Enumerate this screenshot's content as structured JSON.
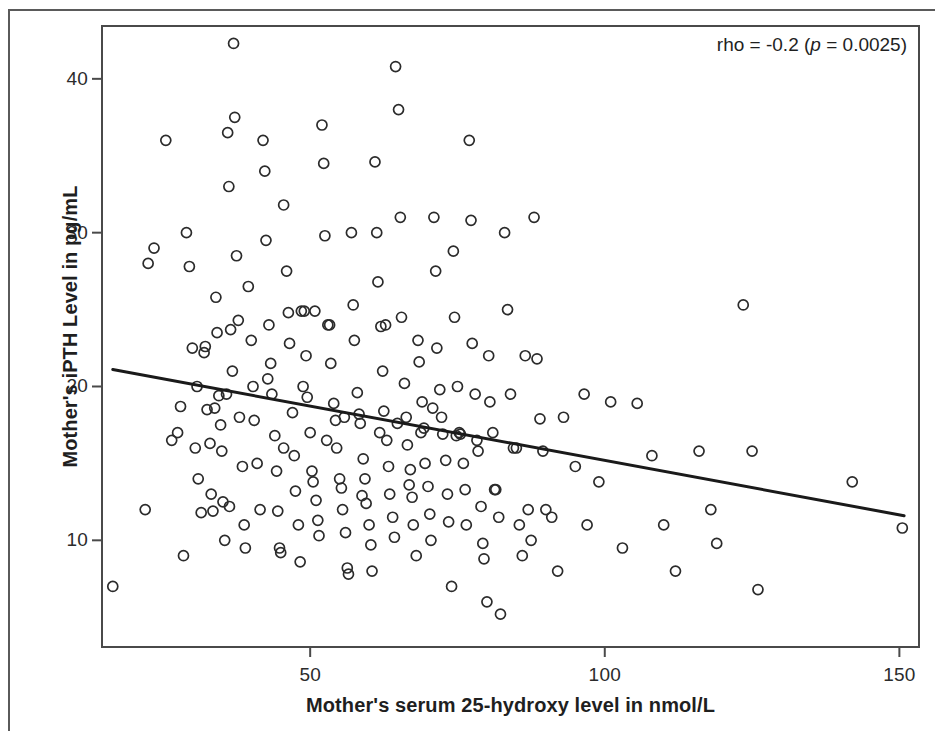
{
  "figure": {
    "background_color": "#ffffff",
    "frame_color": "#4a4a4a",
    "marker_color": "#2b2b2b",
    "line_color": "#1a1a1a"
  },
  "annotation": {
    "prefix": "rho = -0.2 (",
    "italic_p": "p",
    "suffix": " = 0.0025)",
    "full_text": "rho = -0.2 (p = 0.0025)"
  },
  "chart_data": {
    "type": "scatter",
    "title": "",
    "subtitle": "",
    "xlabel": "Mother's serum 25-hydroxy level in nmol/L",
    "ylabel": "Mother's iPTH Level in pg/mL",
    "xlim": [
      14.5,
      153.5
    ],
    "ylim": [
      3.0,
      43.5
    ],
    "xticks": [
      50,
      100,
      150
    ],
    "xtick_labels": [
      "50",
      "100",
      "150"
    ],
    "yticks": [
      10,
      20,
      30,
      40
    ],
    "ytick_labels": [
      "10",
      "20",
      "30",
      "40"
    ],
    "grid": false,
    "legend": null,
    "annotations": [
      {
        "text": "rho = -0.2 (p = 0.0025)",
        "position": "top-right",
        "statistic": "rho",
        "rho": -0.2,
        "p_value": 0.0025
      }
    ],
    "marker": {
      "style": "open-circle",
      "diameter_px": 10,
      "stroke_px": 1.7,
      "fill": "none"
    },
    "fit_line": {
      "type": "linear-regression",
      "x_start": 16.5,
      "y_start": 21.1,
      "x_end": 150.8,
      "y_end": 11.6,
      "slope": -0.0707,
      "intercept": 22.27,
      "width_px": 3
    },
    "n_points": 213,
    "points": [
      [
        16.5,
        7.0
      ],
      [
        22.0,
        12.0
      ],
      [
        23.5,
        29.0
      ],
      [
        22.5,
        28.0
      ],
      [
        25.5,
        36.0
      ],
      [
        26.5,
        16.5
      ],
      [
        27.5,
        17.0
      ],
      [
        28.0,
        18.7
      ],
      [
        28.5,
        9.0
      ],
      [
        29.0,
        30.0
      ],
      [
        29.5,
        27.8
      ],
      [
        30.0,
        22.5
      ],
      [
        30.5,
        16.0
      ],
      [
        31.0,
        14.0
      ],
      [
        31.5,
        11.8
      ],
      [
        32.0,
        22.2
      ],
      [
        32.2,
        22.6
      ],
      [
        32.5,
        18.5
      ],
      [
        33.0,
        16.3
      ],
      [
        33.2,
        13.0
      ],
      [
        33.5,
        11.9
      ],
      [
        34.0,
        25.8
      ],
      [
        34.2,
        23.5
      ],
      [
        34.5,
        19.4
      ],
      [
        34.8,
        17.5
      ],
      [
        35.0,
        15.8
      ],
      [
        35.2,
        12.5
      ],
      [
        35.5,
        10.0
      ],
      [
        36.0,
        36.5
      ],
      [
        36.2,
        33.0
      ],
      [
        36.5,
        23.7
      ],
      [
        36.8,
        21.0
      ],
      [
        37.0,
        42.3
      ],
      [
        37.2,
        37.5
      ],
      [
        37.5,
        28.5
      ],
      [
        37.8,
        24.3
      ],
      [
        38.0,
        18.0
      ],
      [
        38.5,
        14.8
      ],
      [
        38.8,
        11.0
      ],
      [
        39.0,
        9.5
      ],
      [
        39.5,
        26.5
      ],
      [
        40.0,
        23.0
      ],
      [
        40.3,
        20.0
      ],
      [
        40.5,
        17.8
      ],
      [
        41.0,
        15.0
      ],
      [
        41.5,
        12.0
      ],
      [
        42.0,
        36.0
      ],
      [
        42.3,
        34.0
      ],
      [
        42.5,
        29.5
      ],
      [
        43.0,
        24.0
      ],
      [
        43.3,
        21.5
      ],
      [
        43.5,
        19.5
      ],
      [
        44.0,
        16.8
      ],
      [
        44.3,
        14.5
      ],
      [
        44.5,
        11.9
      ],
      [
        45.0,
        9.2
      ],
      [
        45.5,
        31.8
      ],
      [
        46.0,
        27.5
      ],
      [
        46.3,
        24.8
      ],
      [
        46.5,
        22.8
      ],
      [
        47.0,
        18.3
      ],
      [
        47.3,
        15.5
      ],
      [
        47.5,
        13.2
      ],
      [
        48.0,
        11.0
      ],
      [
        48.3,
        8.6
      ],
      [
        48.5,
        24.9
      ],
      [
        49.0,
        24.9
      ],
      [
        49.3,
        22.0
      ],
      [
        49.5,
        19.3
      ],
      [
        50.0,
        17.0
      ],
      [
        50.3,
        14.5
      ],
      [
        50.5,
        13.8
      ],
      [
        51.0,
        12.6
      ],
      [
        51.3,
        11.3
      ],
      [
        51.5,
        10.3
      ],
      [
        52.0,
        37.0
      ],
      [
        52.3,
        34.5
      ],
      [
        52.5,
        29.8
      ],
      [
        53.0,
        24.0
      ],
      [
        53.3,
        24.0
      ],
      [
        53.5,
        21.5
      ],
      [
        54.0,
        18.9
      ],
      [
        54.3,
        17.8
      ],
      [
        54.5,
        16.0
      ],
      [
        55.0,
        14.0
      ],
      [
        55.3,
        13.4
      ],
      [
        55.5,
        12.0
      ],
      [
        56.0,
        10.5
      ],
      [
        56.3,
        8.2
      ],
      [
        56.5,
        7.8
      ],
      [
        57.0,
        30.0
      ],
      [
        57.3,
        25.3
      ],
      [
        57.5,
        23.0
      ],
      [
        58.0,
        19.6
      ],
      [
        58.3,
        18.2
      ],
      [
        58.5,
        17.6
      ],
      [
        59.0,
        15.3
      ],
      [
        59.3,
        14.0
      ],
      [
        59.5,
        12.4
      ],
      [
        60.0,
        11.0
      ],
      [
        60.3,
        9.7
      ],
      [
        60.5,
        8.0
      ],
      [
        61.0,
        34.6
      ],
      [
        61.3,
        30.0
      ],
      [
        61.5,
        26.8
      ],
      [
        62.0,
        23.9
      ],
      [
        62.3,
        21.0
      ],
      [
        62.5,
        18.4
      ],
      [
        63.0,
        16.5
      ],
      [
        63.3,
        14.8
      ],
      [
        63.5,
        13.0
      ],
      [
        64.0,
        11.5
      ],
      [
        64.3,
        10.2
      ],
      [
        64.5,
        40.8
      ],
      [
        65.0,
        38.0
      ],
      [
        65.3,
        31.0
      ],
      [
        65.5,
        24.5
      ],
      [
        66.0,
        20.2
      ],
      [
        66.3,
        18.0
      ],
      [
        66.5,
        16.2
      ],
      [
        67.0,
        14.6
      ],
      [
        67.3,
        12.8
      ],
      [
        67.5,
        11.0
      ],
      [
        68.0,
        9.0
      ],
      [
        68.3,
        23.0
      ],
      [
        68.5,
        21.6
      ],
      [
        69.0,
        19.0
      ],
      [
        69.3,
        17.3
      ],
      [
        69.5,
        15.0
      ],
      [
        70.0,
        13.5
      ],
      [
        70.3,
        11.7
      ],
      [
        70.5,
        10.0
      ],
      [
        71.0,
        31.0
      ],
      [
        71.3,
        27.5
      ],
      [
        71.5,
        22.5
      ],
      [
        72.0,
        19.8
      ],
      [
        72.3,
        18.0
      ],
      [
        72.5,
        16.9
      ],
      [
        73.0,
        15.2
      ],
      [
        73.3,
        13.0
      ],
      [
        73.5,
        11.2
      ],
      [
        74.0,
        7.0
      ],
      [
        74.3,
        28.8
      ],
      [
        74.5,
        24.5
      ],
      [
        75.0,
        20.0
      ],
      [
        75.3,
        17.0
      ],
      [
        75.5,
        16.9
      ],
      [
        76.0,
        15.0
      ],
      [
        76.3,
        13.3
      ],
      [
        76.5,
        11.0
      ],
      [
        77.0,
        36.0
      ],
      [
        77.3,
        30.8
      ],
      [
        77.5,
        22.8
      ],
      [
        78.0,
        19.5
      ],
      [
        78.3,
        16.5
      ],
      [
        78.5,
        15.8
      ],
      [
        79.0,
        12.2
      ],
      [
        79.3,
        9.8
      ],
      [
        79.5,
        8.8
      ],
      [
        80.0,
        6.0
      ],
      [
        80.3,
        22.0
      ],
      [
        80.5,
        19.0
      ],
      [
        81.0,
        17.0
      ],
      [
        81.3,
        13.3
      ],
      [
        81.5,
        13.3
      ],
      [
        82.0,
        11.5
      ],
      [
        82.3,
        5.2
      ],
      [
        83.0,
        30.0
      ],
      [
        83.5,
        25.0
      ],
      [
        84.0,
        19.5
      ],
      [
        84.5,
        16.0
      ],
      [
        85.0,
        16.0
      ],
      [
        85.5,
        11.0
      ],
      [
        86.0,
        9.0
      ],
      [
        86.5,
        22.0
      ],
      [
        87.0,
        12.0
      ],
      [
        87.5,
        10.0
      ],
      [
        88.0,
        31.0
      ],
      [
        88.5,
        21.8
      ],
      [
        89.0,
        17.9
      ],
      [
        89.5,
        15.8
      ],
      [
        90.0,
        12.0
      ],
      [
        91.0,
        11.5
      ],
      [
        92.0,
        8.0
      ],
      [
        93.0,
        18.0
      ],
      [
        95.0,
        14.8
      ],
      [
        96.5,
        19.5
      ],
      [
        97.0,
        11.0
      ],
      [
        99.0,
        13.8
      ],
      [
        101.0,
        19.0
      ],
      [
        103.0,
        9.5
      ],
      [
        105.5,
        18.9
      ],
      [
        108.0,
        15.5
      ],
      [
        110.0,
        11.0
      ],
      [
        112.0,
        8.0
      ],
      [
        116.0,
        15.8
      ],
      [
        118.0,
        12.0
      ],
      [
        119.0,
        9.8
      ],
      [
        123.5,
        25.3
      ],
      [
        125.0,
        15.8
      ],
      [
        126.0,
        6.8
      ],
      [
        142.0,
        13.8
      ],
      [
        150.5,
        10.8
      ],
      [
        33.8,
        18.6
      ],
      [
        35.8,
        19.5
      ],
      [
        44.8,
        9.5
      ],
      [
        52.8,
        16.5
      ],
      [
        58.8,
        12.9
      ],
      [
        62.8,
        24.0
      ],
      [
        66.8,
        13.6
      ],
      [
        70.8,
        18.6
      ],
      [
        74.8,
        16.8
      ],
      [
        42.8,
        20.5
      ],
      [
        36.3,
        12.2
      ],
      [
        30.8,
        20.0
      ],
      [
        48.8,
        20.0
      ],
      [
        55.8,
        18.0
      ],
      [
        61.8,
        17.0
      ],
      [
        64.8,
        17.6
      ],
      [
        68.8,
        17.0
      ],
      [
        45.5,
        16.0
      ],
      [
        50.8,
        24.9
      ]
    ]
  }
}
